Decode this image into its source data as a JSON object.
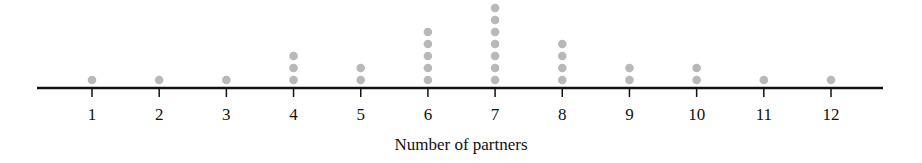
{
  "chart_data": {
    "type": "dot",
    "title": "",
    "xlabel": "Number of partners",
    "ylabel": "",
    "categories": [
      1,
      2,
      3,
      4,
      5,
      6,
      7,
      8,
      9,
      10,
      11,
      12
    ],
    "values": [
      1,
      1,
      1,
      3,
      2,
      5,
      7,
      4,
      2,
      2,
      1,
      1
    ],
    "tick_labels": [
      "1",
      "2",
      "3",
      "4",
      "5",
      "6",
      "7",
      "8",
      "9",
      "10",
      "11",
      "12"
    ],
    "xlim": [
      0.3,
      13.1
    ],
    "grid": false,
    "legend": null,
    "dot_color": "#b8b8b8",
    "axis_color": "#111111"
  }
}
